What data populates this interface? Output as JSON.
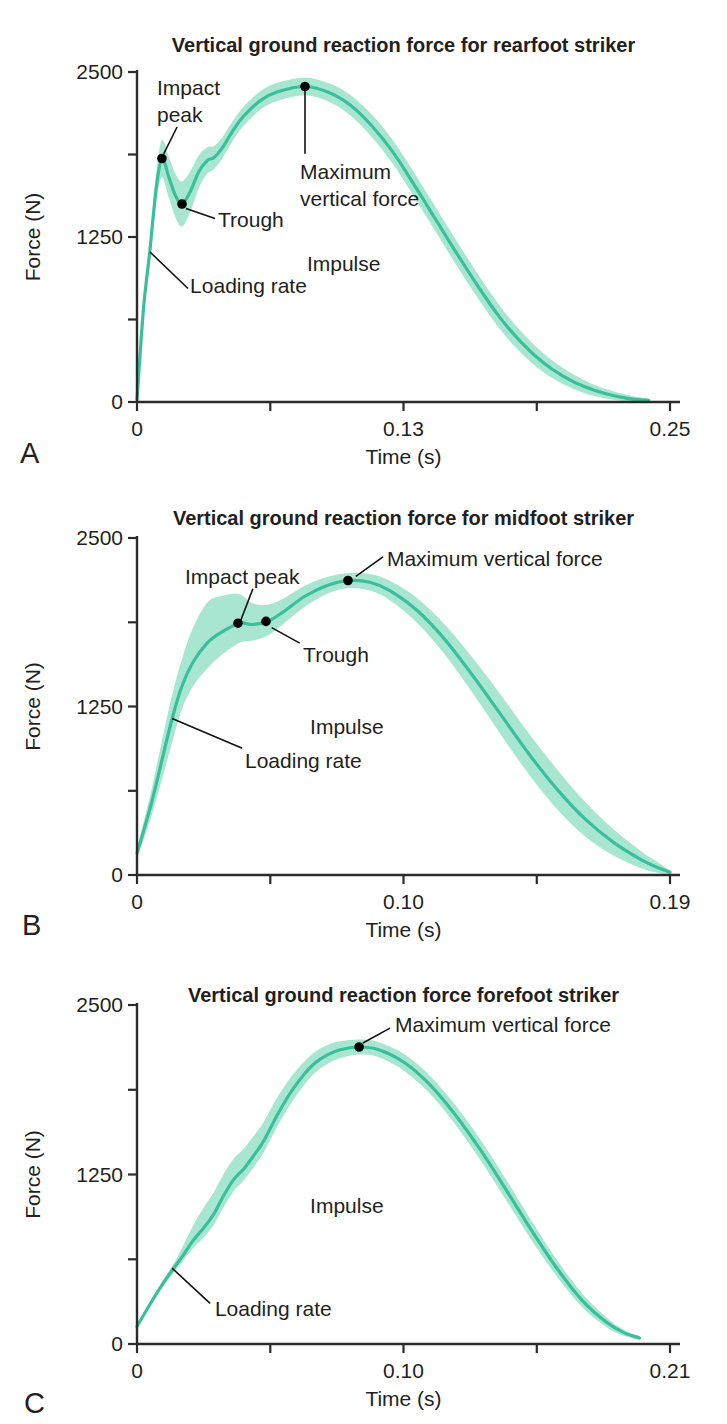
{
  "colors": {
    "curve_line": "#3abf9b",
    "curve_band": "#a8e6d1",
    "axis": "#2b2b2b",
    "text": "#231f20",
    "annotation_dot": "#000000",
    "background": "#ffffff"
  },
  "chart_data": [
    {
      "type": "line",
      "panel_label": "A",
      "title": "Vertical ground reaction force for rearfoot striker",
      "xlabel": "Time (s)",
      "ylabel": "Force (N)",
      "ylim": [
        0,
        2500
      ],
      "xlim": [
        0,
        0.25
      ],
      "grid": false,
      "xtick_labels": [
        "0",
        "",
        "0.13",
        "",
        "0.25"
      ],
      "ytick_values": [
        0,
        625,
        1250,
        1875,
        2500
      ],
      "ytick_labels": [
        "0",
        "",
        "1250",
        "",
        "2500"
      ],
      "series": [
        {
          "name": "mean vertical ground reaction force with variability band",
          "points": [
            [
              0,
              20,
              8
            ],
            [
              0.003,
              700,
              45
            ],
            [
              0.006,
              1140,
              75
            ],
            [
              0.009,
              1620,
              110
            ],
            [
              0.0117,
              1845,
              140
            ],
            [
              0.015,
              1700,
              155
            ],
            [
              0.018,
              1565,
              165
            ],
            [
              0.0211,
              1500,
              170
            ],
            [
              0.025,
              1595,
              155
            ],
            [
              0.029,
              1745,
              125
            ],
            [
              0.033,
              1830,
              100
            ],
            [
              0.036,
              1850,
              88
            ],
            [
              0.04,
              1925,
              80
            ],
            [
              0.045,
              2055,
              75
            ],
            [
              0.05,
              2165,
              72
            ],
            [
              0.058,
              2285,
              70
            ],
            [
              0.066,
              2350,
              68
            ],
            [
              0.0788,
              2390,
              66
            ],
            [
              0.09,
              2345,
              70
            ],
            [
              0.1,
              2250,
              78
            ],
            [
              0.11,
              2095,
              85
            ],
            [
              0.12,
              1895,
              90
            ],
            [
              0.13,
              1645,
              92
            ],
            [
              0.14,
              1385,
              93
            ],
            [
              0.15,
              1125,
              93
            ],
            [
              0.16,
              875,
              92
            ],
            [
              0.17,
              645,
              88
            ],
            [
              0.18,
              455,
              82
            ],
            [
              0.19,
              305,
              72
            ],
            [
              0.2,
              195,
              60
            ],
            [
              0.21,
              115,
              48
            ],
            [
              0.22,
              62,
              36
            ],
            [
              0.23,
              28,
              24
            ],
            [
              0.24,
              12,
              12
            ]
          ]
        }
      ],
      "annotations": [
        {
          "name": "impact-peak",
          "lines": [
            "Impact",
            "peak"
          ],
          "dot": [
            0.0117,
            1845
          ],
          "leader": [
            [
              0.0188,
              2083
            ],
            [
              0.0125,
              1880
            ]
          ],
          "label_pos": [
            0.0094,
            2470
          ]
        },
        {
          "name": "trough",
          "lines": [
            "Trough"
          ],
          "dot": [
            0.0211,
            1500
          ],
          "leader": [
            [
              0.023,
              1465
            ],
            [
              0.0366,
              1390
            ]
          ],
          "label_pos": [
            0.038,
            1470
          ]
        },
        {
          "name": "maximum-vertical-force",
          "lines": [
            "Maximum",
            "vertical force"
          ],
          "dot": [
            0.0788,
            2390
          ],
          "leader": [
            [
              0.0788,
              2360
            ],
            [
              0.0788,
              1880
            ]
          ],
          "label_pos": [
            0.0765,
            1830
          ]
        },
        {
          "name": "loading-rate",
          "lines": [
            "Loading rate"
          ],
          "leader": [
            [
              0.0061,
              1136
            ],
            [
              0.0239,
              860
            ]
          ],
          "label_pos": [
            0.0249,
            970
          ]
        },
        {
          "name": "impulse",
          "lines": [
            "Impulse"
          ],
          "label_pos": [
            0.0797,
            1140
          ]
        }
      ]
    },
    {
      "type": "line",
      "panel_label": "B",
      "title": "Vertical ground reaction force for midfoot striker",
      "xlabel": "Time (s)",
      "ylabel": "Force (N)",
      "ylim": [
        0,
        2500
      ],
      "xlim": [
        0,
        0.19
      ],
      "grid": false,
      "xtick_labels": [
        "0",
        "",
        "0.10",
        "",
        "0.19"
      ],
      "ytick_values": [
        0,
        625,
        1250,
        1875,
        2500
      ],
      "ytick_labels": [
        "0",
        "",
        "1250",
        "",
        "2500"
      ],
      "series": [
        {
          "name": "mean vertical ground reaction force with variability band",
          "points": [
            [
              0,
              160,
              35
            ],
            [
              0.005,
              520,
              95
            ],
            [
              0.009,
              860,
              145
            ],
            [
              0.0124,
              1150,
              175
            ],
            [
              0.016,
              1400,
              200,
              170
            ],
            [
              0.02,
              1580,
              255,
              180
            ],
            [
              0.025,
              1720,
              300,
              190
            ],
            [
              0.03,
              1800,
              270,
              170
            ],
            [
              0.0366,
              1868,
              215,
              145
            ],
            [
              0.041,
              1858,
              160,
              120
            ],
            [
              0.0465,
              1880,
              125,
              105
            ],
            [
              0.052,
              1950,
              100,
              90
            ],
            [
              0.06,
              2070,
              78
            ],
            [
              0.068,
              2150,
              62
            ],
            [
              0.0756,
              2185,
              56
            ],
            [
              0.083,
              2172,
              62
            ],
            [
              0.09,
              2112,
              72
            ],
            [
              0.1,
              1960,
              92
            ],
            [
              0.11,
              1740,
              112
            ],
            [
              0.12,
              1470,
              132
            ],
            [
              0.13,
              1180,
              148
            ],
            [
              0.14,
              890,
              152
            ],
            [
              0.15,
              630,
              147
            ],
            [
              0.16,
              410,
              127
            ],
            [
              0.17,
              240,
              97
            ],
            [
              0.18,
              110,
              62
            ],
            [
              0.186,
              52,
              38
            ],
            [
              0.19,
              20,
              16
            ]
          ]
        }
      ],
      "annotations": [
        {
          "name": "impact-peak",
          "lines": [
            "Impact peak"
          ],
          "dot": [
            0.036,
            1868
          ],
          "leader": [
            [
              0.0413,
              2124
            ],
            [
              0.037,
              1890
            ]
          ],
          "label_pos": [
            0.0171,
            2300
          ]
        },
        {
          "name": "trough",
          "lines": [
            "Trough"
          ],
          "dot": [
            0.046,
            1881
          ],
          "leader": [
            [
              0.048,
              1835
            ],
            [
              0.058,
              1720
            ]
          ],
          "label_pos": [
            0.0592,
            1725
          ]
        },
        {
          "name": "maximum-vertical-force",
          "lines": [
            "Maximum vertical force"
          ],
          "dot": [
            0.0752,
            2185
          ],
          "leader": [
            [
              0.0877,
              2360
            ],
            [
              0.078,
              2215
            ]
          ],
          "label_pos": [
            0.0891,
            2435
          ]
        },
        {
          "name": "loading-rate",
          "lines": [
            "Loading rate"
          ],
          "leader": [
            [
              0.0125,
              1160
            ],
            [
              0.0375,
              940
            ]
          ],
          "label_pos": [
            0.0385,
            935
          ]
        },
        {
          "name": "impulse",
          "lines": [
            "Impulse"
          ],
          "label_pos": [
            0.0617,
            1190
          ]
        }
      ]
    },
    {
      "type": "line",
      "panel_label": "C",
      "title": "Vertical ground reaction force forefoot striker",
      "xlabel": "Time (s)",
      "ylabel": "Force (N)",
      "ylim": [
        0,
        2500
      ],
      "xlim": [
        0,
        0.21
      ],
      "grid": false,
      "xtick_labels": [
        "0",
        "",
        "0.10",
        "",
        "0.21"
      ],
      "ytick_values": [
        0,
        625,
        1250,
        1875,
        2500
      ],
      "ytick_labels": [
        "0",
        "",
        "1250",
        "",
        "2500"
      ],
      "series": [
        {
          "name": "mean vertical ground reaction force with variability band",
          "points": [
            [
              0,
              130,
              10
            ],
            [
              0.005,
              290,
              14
            ],
            [
              0.01,
              440,
              22
            ],
            [
              0.0145,
              560,
              34
            ],
            [
              0.018,
              650,
              70,
              40
            ],
            [
              0.022,
              760,
              110,
              55
            ],
            [
              0.026,
              850,
              150,
              70
            ],
            [
              0.03,
              950,
              160,
              80
            ],
            [
              0.034,
              1090,
              160,
              85
            ],
            [
              0.038,
              1210,
              155,
              85
            ],
            [
              0.042,
              1290,
              150,
              85
            ],
            [
              0.046,
              1390,
              145,
              85
            ],
            [
              0.05,
              1500,
              140,
              85
            ],
            [
              0.055,
              1680,
              130,
              85
            ],
            [
              0.06,
              1840,
              112,
              85
            ],
            [
              0.065,
              1970,
              95,
              80
            ],
            [
              0.07,
              2070,
              82,
              72
            ],
            [
              0.075,
              2132,
              72,
              66
            ],
            [
              0.08,
              2170,
              62
            ],
            [
              0.0875,
              2190,
              56
            ],
            [
              0.095,
              2172,
              56
            ],
            [
              0.105,
              2080,
              62
            ],
            [
              0.115,
              1920,
              66
            ],
            [
              0.125,
              1700,
              72
            ],
            [
              0.135,
              1440,
              76
            ],
            [
              0.145,
              1150,
              76
            ],
            [
              0.155,
              850,
              72
            ],
            [
              0.165,
              570,
              62
            ],
            [
              0.175,
              330,
              52
            ],
            [
              0.185,
              160,
              36
            ],
            [
              0.192,
              82,
              22
            ],
            [
              0.198,
              45,
              12
            ]
          ]
        }
      ],
      "annotations": [
        {
          "name": "maximum-vertical-force",
          "lines": [
            "Maximum vertical force"
          ],
          "dot": [
            0.0875,
            2190
          ],
          "leader": [
            [
              0.0997,
              2330
            ],
            [
              0.089,
              2220
            ]
          ],
          "label_pos": [
            0.1017,
            2445
          ]
        },
        {
          "name": "loading-rate",
          "lines": [
            "Loading rate"
          ],
          "leader": [
            [
              0.0138,
              560
            ],
            [
              0.0288,
              300
            ]
          ],
          "label_pos": [
            0.0307,
            350
          ]
        },
        {
          "name": "impulse",
          "lines": [
            "Impulse"
          ],
          "label_pos": [
            0.0682,
            1105
          ]
        }
      ]
    }
  ]
}
